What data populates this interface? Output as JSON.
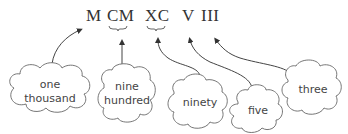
{
  "numerals": [
    {
      "text": "M",
      "x": 86
    },
    {
      "text": "CM",
      "x": 107
    },
    {
      "text": "XC",
      "x": 145
    },
    {
      "text": "V",
      "x": 182
    },
    {
      "text": "III",
      "x": 201
    }
  ],
  "clouds": [
    {
      "label": "one thousand",
      "line1": "one",
      "line2": "thousand"
    },
    {
      "label": "nine hundred",
      "line1": "nine",
      "line2": "hundred"
    },
    {
      "label": "ninety",
      "line1": "ninety",
      "line2": ""
    },
    {
      "label": "five",
      "line1": "five",
      "line2": ""
    },
    {
      "label": "three",
      "line1": "three",
      "line2": ""
    }
  ],
  "colors": {
    "ink": "#444444",
    "line": "#555555"
  }
}
